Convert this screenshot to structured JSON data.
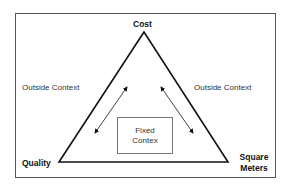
{
  "diagram": {
    "vertices": {
      "top": "Cost",
      "bottom_left": "Quality",
      "bottom_right_line1": "Square",
      "bottom_right_line2": "Meters"
    },
    "outside_left": "Outside Context",
    "outside_right": "Outside Context",
    "center_box": {
      "line1": "Fixed",
      "line2": "Contex"
    },
    "colors": {
      "line": "#111111",
      "frame": "#555555",
      "box_border": "#777777",
      "text": "#333333"
    }
  }
}
